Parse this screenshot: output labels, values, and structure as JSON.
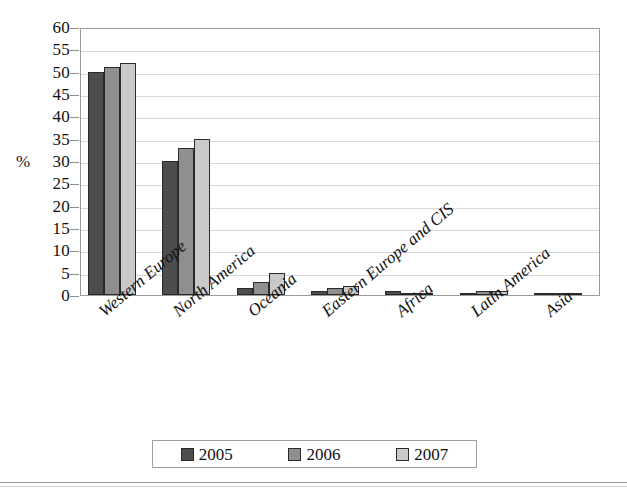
{
  "chart_data": {
    "type": "bar",
    "title": "",
    "subtitle": "",
    "xlabel": "",
    "ylabel": "%",
    "ylim": [
      0,
      60
    ],
    "ytick_step": 5,
    "yticks": [
      "60",
      "55",
      "50",
      "45",
      "40",
      "35",
      "30",
      "25",
      "20",
      "15",
      "10",
      "5",
      "0"
    ],
    "grid": true,
    "legend_position": "bottom",
    "categories": [
      "Western Europe",
      "North America",
      "Oceania",
      "Eastern Europe and CIS",
      "Africa",
      "Latin America",
      "Asia"
    ],
    "series": [
      {
        "name": "2005",
        "color": "#4d4d4d",
        "values": [
          50,
          30,
          1.5,
          1,
          1,
          0.3,
          0.2
        ]
      },
      {
        "name": "2006",
        "color": "#8f8f8f",
        "values": [
          51,
          33,
          3,
          1.5,
          0.3,
          1,
          0.2
        ]
      },
      {
        "name": "2007",
        "color": "#c9c9c9",
        "values": [
          52,
          35,
          5,
          2,
          0.3,
          1,
          0.2
        ]
      }
    ]
  },
  "legend": {
    "items": [
      {
        "label": "2005"
      },
      {
        "label": "2006"
      },
      {
        "label": "2007"
      }
    ]
  },
  "axis": {
    "unit_label": "%"
  }
}
